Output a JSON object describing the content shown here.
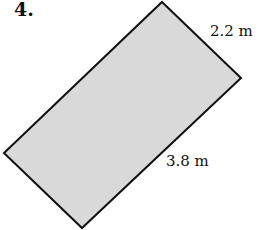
{
  "problem": {
    "number": "4.",
    "shape": "rectangle",
    "fill_color": "#d9d9d9",
    "stroke_color": "#111111",
    "dimensions": {
      "width_label": "2.2 m",
      "length_label": "3.8 m"
    }
  }
}
